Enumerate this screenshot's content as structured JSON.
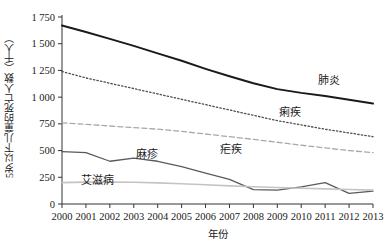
{
  "chart_data": {
    "type": "line",
    "title": "",
    "xlabel": "年份",
    "ylabel": "5岁以下儿童的死亡人数（千人）",
    "x": [
      2000,
      2001,
      2002,
      2003,
      2004,
      2005,
      2006,
      2007,
      2008,
      2009,
      2010,
      2011,
      2012,
      2013
    ],
    "categories": [
      "2000",
      "2001",
      "2002",
      "2003",
      "2004",
      "2005",
      "2006",
      "2007",
      "2008",
      "2009",
      "2010",
      "2011",
      "2012",
      "2013"
    ],
    "ylim": [
      0,
      1750
    ],
    "yticks": [
      0,
      250,
      500,
      750,
      1000,
      1250,
      1500,
      1750
    ],
    "ytick_labels": [
      "0",
      "250",
      "500",
      "750",
      "1 000",
      "1 250",
      "1 500",
      "1 750"
    ],
    "grid": false,
    "legend": "inline-labels",
    "series": [
      {
        "name": "肺炎",
        "label": "肺炎",
        "color": "#1a1a1a",
        "style": "solid",
        "width": 2.0,
        "values": [
          1670,
          1610,
          1545,
          1480,
          1410,
          1340,
          1265,
          1195,
          1130,
          1075,
          1040,
          1010,
          975,
          940
        ]
      },
      {
        "name": "痢疾",
        "label": "痢疾",
        "color": "#4d4d4d",
        "style": "dotted",
        "width": 1.3,
        "values": [
          1240,
          1180,
          1130,
          1080,
          1030,
          980,
          930,
          880,
          830,
          780,
          740,
          700,
          665,
          630
        ]
      },
      {
        "name": "疟疾",
        "label": "疟疾",
        "color": "#a8a8a8",
        "style": "dashed",
        "width": 1.3,
        "values": [
          760,
          745,
          730,
          715,
          700,
          680,
          655,
          630,
          605,
          578,
          550,
          525,
          500,
          480
        ]
      },
      {
        "name": "麻疹",
        "label": "麻疹",
        "color": "#5a5a5a",
        "style": "solid",
        "width": 1.3,
        "values": [
          490,
          480,
          400,
          430,
          400,
          350,
          290,
          230,
          135,
          130,
          160,
          200,
          100,
          120
        ]
      },
      {
        "name": "艾滋病",
        "label": "艾滋病",
        "color": "#c4c4c4",
        "style": "solid",
        "width": 1.6,
        "values": [
          200,
          205,
          205,
          203,
          198,
          190,
          180,
          170,
          162,
          155,
          148,
          142,
          136,
          130
        ]
      }
    ],
    "series_label_positions": [
      {
        "name": "肺炎",
        "x": 2011.15,
        "y": 1120
      },
      {
        "name": "痢疾",
        "x": 2009.55,
        "y": 820
      },
      {
        "name": "疟疾",
        "x": 2007.05,
        "y": 480
      },
      {
        "name": "麻疹",
        "x": 2003.55,
        "y": 430
      },
      {
        "name": "艾滋病",
        "x": 2001.5,
        "y": 190
      }
    ]
  }
}
